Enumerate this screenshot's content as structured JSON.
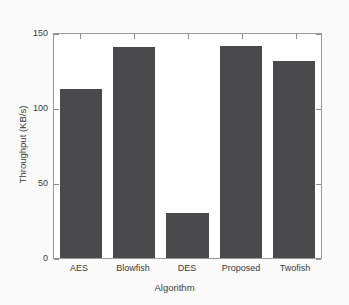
{
  "chart_data": {
    "type": "bar",
    "title": "",
    "subtitle": "",
    "xlabel": "Algorithm",
    "ylabel": "Throughput (KB/s)",
    "categories": [
      "AES",
      "Blowfish",
      "DES",
      "Proposed",
      "Twofish"
    ],
    "values": [
      113,
      141,
      30,
      142,
      132
    ],
    "series": [
      {
        "name": "Throughput",
        "values": [
          113,
          141,
          30,
          142,
          132
        ]
      }
    ],
    "ylim": [
      0,
      150
    ],
    "yticks": [
      0,
      50,
      100,
      150
    ],
    "ytick_labels": [
      "0",
      "50",
      "100",
      "150"
    ],
    "grid": false,
    "legend": false,
    "legend_position": "none",
    "bar_color": "#4a4a4d",
    "axis_color": "#9a9a9a",
    "background_color": "#fbfbfb",
    "plot_background_color": "#ffffff",
    "annotations": []
  }
}
